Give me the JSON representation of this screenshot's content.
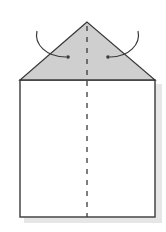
{
  "diagram": {
    "type": "origami-fold-step",
    "colors": {
      "background": "#ffffff",
      "paper": "#ffffff",
      "flap_fill": "#cfcfcf",
      "outline": "#3a3a3a",
      "crease": "#3a3a3a",
      "arrow": "#3a3a3a",
      "shadow": "#e4e4e4"
    },
    "shapes": {
      "triangle_flap": {
        "apex": [
          87,
          22
        ],
        "base_left": [
          20,
          80
        ],
        "base_right": [
          155,
          80
        ]
      },
      "rectangle_body": {
        "x": 20,
        "y": 80,
        "width": 135,
        "height": 137
      },
      "center_crease": {
        "x": 87,
        "y_start": 24,
        "y_end": 217,
        "style": "dashed"
      },
      "arrows": [
        {
          "name": "left-fold-arrow",
          "start": [
            37,
            31
          ],
          "end": [
            68,
            57
          ],
          "direction": "inward-right"
        },
        {
          "name": "right-fold-arrow",
          "start": [
            138,
            31
          ],
          "end": [
            108,
            57
          ],
          "direction": "inward-left"
        }
      ]
    }
  }
}
